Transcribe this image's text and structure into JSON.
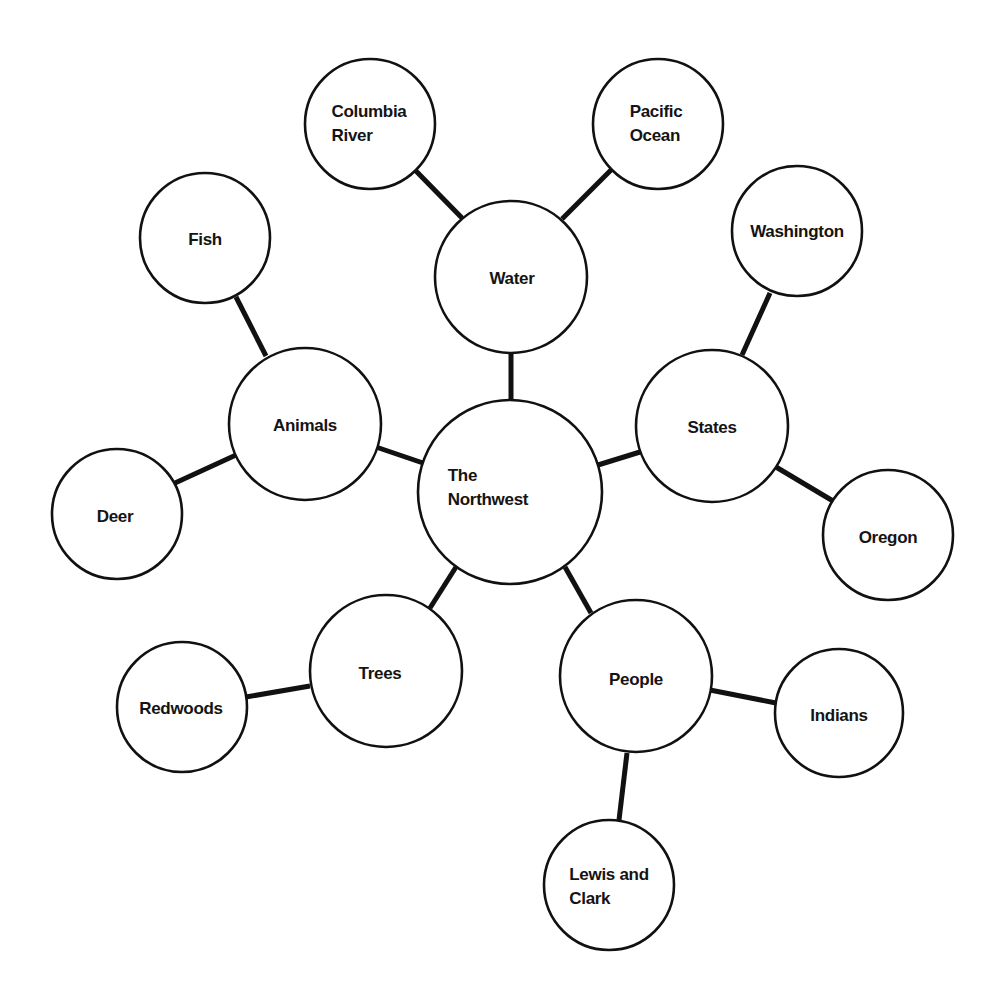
{
  "diagram": {
    "type": "concept-web",
    "central_topic": "The Northwest",
    "colors": {
      "background": "#ffffff",
      "stroke": "#111111",
      "text": "#141414"
    },
    "nodes": [
      {
        "id": "northwest",
        "label": "The\nNorthwest",
        "cx": 510,
        "cy": 492,
        "r": 92,
        "lx": 488,
        "ly": 488,
        "align": "left"
      },
      {
        "id": "water",
        "label": "Water",
        "cx": 511,
        "cy": 277,
        "r": 76,
        "lx": 512,
        "ly": 279,
        "align": "center"
      },
      {
        "id": "columbia-river",
        "label": "Columbia\nRiver",
        "cx": 370,
        "cy": 124,
        "r": 65,
        "lx": 369,
        "ly": 124,
        "align": "left"
      },
      {
        "id": "pacific-ocean",
        "label": "Pacific\nOcean",
        "cx": 658,
        "cy": 124,
        "r": 65,
        "lx": 656,
        "ly": 124,
        "align": "left"
      },
      {
        "id": "animals",
        "label": "Animals",
        "cx": 305,
        "cy": 424,
        "r": 76,
        "lx": 305,
        "ly": 426,
        "align": "center"
      },
      {
        "id": "fish",
        "label": "Fish",
        "cx": 205,
        "cy": 238,
        "r": 65,
        "lx": 205,
        "ly": 240,
        "align": "center"
      },
      {
        "id": "deer",
        "label": "Deer",
        "cx": 117,
        "cy": 514,
        "r": 65,
        "lx": 115,
        "ly": 517,
        "align": "center"
      },
      {
        "id": "states",
        "label": "States",
        "cx": 712,
        "cy": 426,
        "r": 76,
        "lx": 712,
        "ly": 428,
        "align": "center"
      },
      {
        "id": "washington",
        "label": "Washington",
        "cx": 797,
        "cy": 231,
        "r": 65,
        "lx": 797,
        "ly": 232,
        "align": "center"
      },
      {
        "id": "oregon",
        "label": "Oregon",
        "cx": 888,
        "cy": 535,
        "r": 65,
        "lx": 888,
        "ly": 538,
        "align": "center"
      },
      {
        "id": "trees",
        "label": "Trees",
        "cx": 386,
        "cy": 671,
        "r": 76,
        "lx": 380,
        "ly": 674,
        "align": "center"
      },
      {
        "id": "redwoods",
        "label": "Redwoods",
        "cx": 182,
        "cy": 707,
        "r": 65,
        "lx": 181,
        "ly": 709,
        "align": "center"
      },
      {
        "id": "people",
        "label": "People",
        "cx": 636,
        "cy": 676,
        "r": 76,
        "lx": 636,
        "ly": 680,
        "align": "center"
      },
      {
        "id": "indians",
        "label": "Indians",
        "cx": 839,
        "cy": 713,
        "r": 64,
        "lx": 839,
        "ly": 716,
        "align": "center"
      },
      {
        "id": "lewis-and-clark",
        "label": "Lewis and\nClark",
        "cx": 609,
        "cy": 885,
        "r": 65,
        "lx": 609,
        "ly": 887,
        "align": "left"
      }
    ],
    "edges": [
      {
        "from": "northwest",
        "to": "water",
        "x1": 511,
        "y1": 400,
        "x2": 511,
        "y2": 353
      },
      {
        "from": "water",
        "to": "columbia-river",
        "x1": 462,
        "y1": 218,
        "x2": 416,
        "y2": 171
      },
      {
        "from": "water",
        "to": "pacific-ocean",
        "x1": 562,
        "y1": 219,
        "x2": 611,
        "y2": 170
      },
      {
        "from": "northwest",
        "to": "animals",
        "x1": 423,
        "y1": 463,
        "x2": 376,
        "y2": 447
      },
      {
        "from": "animals",
        "to": "fish",
        "x1": 266,
        "y1": 356,
        "x2": 236,
        "y2": 297
      },
      {
        "from": "animals",
        "to": "deer",
        "x1": 236,
        "y1": 455,
        "x2": 175,
        "y2": 483
      },
      {
        "from": "northwest",
        "to": "states",
        "x1": 598,
        "y1": 465,
        "x2": 640,
        "y2": 452
      },
      {
        "from": "states",
        "to": "washington",
        "x1": 742,
        "y1": 355,
        "x2": 770,
        "y2": 293
      },
      {
        "from": "states",
        "to": "oregon",
        "x1": 776,
        "y1": 467,
        "x2": 833,
        "y2": 501
      },
      {
        "from": "northwest",
        "to": "trees",
        "x1": 456,
        "y1": 567,
        "x2": 430,
        "y2": 608
      },
      {
        "from": "trees",
        "to": "redwoods",
        "x1": 310,
        "y1": 686,
        "x2": 246,
        "y2": 697
      },
      {
        "from": "northwest",
        "to": "people",
        "x1": 565,
        "y1": 567,
        "x2": 591,
        "y2": 613
      },
      {
        "from": "people",
        "to": "indians",
        "x1": 710,
        "y1": 690,
        "x2": 776,
        "y2": 703
      },
      {
        "from": "people",
        "to": "lewis-and-clark",
        "x1": 627,
        "y1": 753,
        "x2": 619,
        "y2": 820
      }
    ]
  }
}
